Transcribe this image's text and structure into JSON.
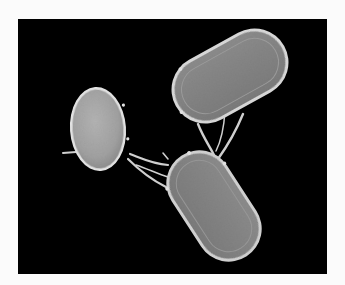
{
  "image": {
    "kind": "micrograph",
    "description": "Grayscale scanning electron micrograph of three rod-shaped bacteria on a black background, connected by thin filaments (pili)",
    "subjects": [
      {
        "name": "bacterium-top-right",
        "shape": "capsule",
        "label": "rod-shaped bacterium"
      },
      {
        "name": "bacterium-left",
        "shape": "oval",
        "label": "oval bacterium"
      },
      {
        "name": "bacterium-bottom",
        "shape": "capsule",
        "label": "rod-shaped bacterium"
      }
    ],
    "colors": {
      "background": "#000000",
      "margin": "#fbfbfb",
      "cell_rim": "#d8d8d8",
      "cell_body": "#8e8e8e",
      "cell_inner": "#7a7a7a",
      "filament": "#d0d0d0"
    }
  }
}
